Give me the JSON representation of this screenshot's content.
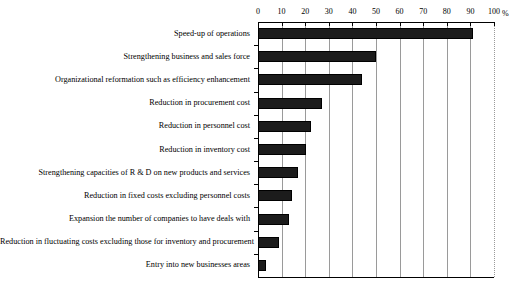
{
  "chart_data": {
    "type": "bar",
    "orientation": "horizontal",
    "title": "",
    "xlabel": "%",
    "ylabel": "",
    "xlim": [
      0,
      100
    ],
    "xticks": [
      0,
      10,
      20,
      30,
      40,
      50,
      60,
      70,
      80,
      90,
      100
    ],
    "grid": true,
    "legend": null,
    "axis_unit": "%",
    "categories": [
      "Speed-up of operations",
      "Strengthening business and sales force",
      "Organizational reformation such as efficiency enhancement",
      "Reduction in procurement cost",
      "Reduction in personnel cost",
      "Reduction in inventory cost",
      "Strengthening capacities of R & D on new products and services",
      "Reduction in fixed costs excluding personnel costs",
      "Expansion the number of companies to have deals with",
      "Reduction in fluctuating costs excluding those for inventory and procurement",
      "Entry into new businesses areas"
    ],
    "values": [
      91,
      50,
      44,
      27,
      22.5,
      20.5,
      17,
      14.5,
      13,
      9,
      3.5
    ],
    "bar_color": "#1c1c1c",
    "grid_color": "#9a9a9a",
    "axis_color": "#000000"
  }
}
